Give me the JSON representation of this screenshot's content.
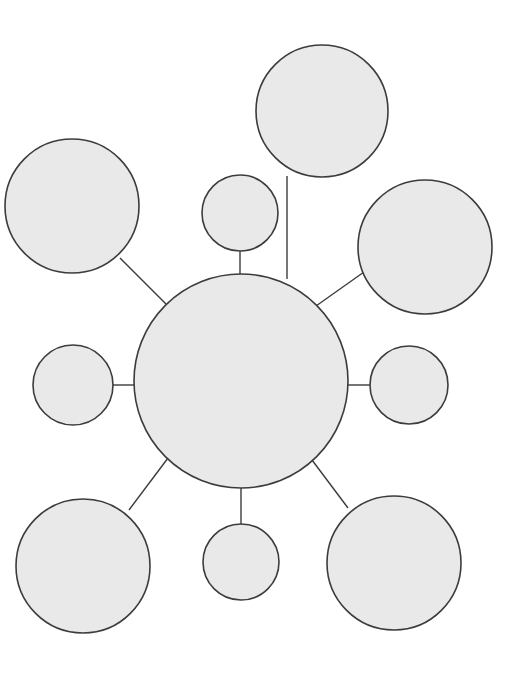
{
  "page": {
    "width": 523,
    "height": 687,
    "background_color": "#ffffff"
  },
  "style": {
    "node_fill": "#e9e9e9",
    "node_stroke": "#3c3c3c",
    "node_stroke_width": 1.6,
    "connector_stroke": "#3c3c3c",
    "connector_stroke_width": 1.4
  },
  "chart_data": {
    "type": "diagram",
    "subtype": "hub-and-spoke concept map",
    "title": "",
    "note": "Blank graphic organizer: one central hub circle linked by straight-line spokes to nine empty satellite circles. All circles are unlabeled.",
    "hub": {
      "id": "hub",
      "label": "",
      "cx": 241,
      "cy": 381,
      "r": 107,
      "size": "large"
    },
    "nodes": [
      {
        "id": "node-top-center-small",
        "label": "",
        "cx": 240,
        "cy": 213,
        "r": 38,
        "size": "small",
        "position": "top-center"
      },
      {
        "id": "node-top-right-large",
        "label": "",
        "cx": 322,
        "cy": 111,
        "r": 66,
        "size": "large",
        "position": "top-right"
      },
      {
        "id": "node-upper-left-large",
        "label": "",
        "cx": 72,
        "cy": 206,
        "r": 67,
        "size": "large",
        "position": "upper-left"
      },
      {
        "id": "node-right-upper-large",
        "label": "",
        "cx": 425,
        "cy": 247,
        "r": 67,
        "size": "large",
        "position": "right-upper"
      },
      {
        "id": "node-left-small",
        "label": "",
        "cx": 73,
        "cy": 385,
        "r": 40,
        "size": "small",
        "position": "left"
      },
      {
        "id": "node-right-small",
        "label": "",
        "cx": 409,
        "cy": 385,
        "r": 39,
        "size": "small",
        "position": "right"
      },
      {
        "id": "node-bottom-left-large",
        "label": "",
        "cx": 83,
        "cy": 566,
        "r": 67,
        "size": "large",
        "position": "bottom-left"
      },
      {
        "id": "node-bottom-center-small",
        "label": "",
        "cx": 241,
        "cy": 562,
        "r": 38,
        "size": "small",
        "position": "bottom-center"
      },
      {
        "id": "node-bottom-right-large",
        "label": "",
        "cx": 394,
        "cy": 563,
        "r": 67,
        "size": "large",
        "position": "bottom-right"
      }
    ],
    "edges": [
      {
        "id": "edge-hub-top-center-small",
        "from": "hub",
        "to": "node-top-center-small",
        "x1": 240,
        "y1": 275,
        "x2": 240,
        "y2": 251
      },
      {
        "id": "edge-hub-top-right-large",
        "from": "hub",
        "to": "node-top-right-large",
        "x1": 287,
        "y1": 279,
        "x2": 287,
        "y2": 176
      },
      {
        "id": "edge-hub-upper-left-large",
        "from": "hub",
        "to": "node-upper-left-large",
        "x1": 167,
        "y1": 305,
        "x2": 120,
        "y2": 258
      },
      {
        "id": "edge-hub-right-upper-large",
        "from": "hub",
        "to": "node-right-upper-large",
        "x1": 316,
        "y1": 306,
        "x2": 364,
        "y2": 272
      },
      {
        "id": "edge-hub-left-small",
        "from": "hub",
        "to": "node-left-small",
        "x1": 134,
        "y1": 385,
        "x2": 113,
        "y2": 385
      },
      {
        "id": "edge-hub-right-small",
        "from": "hub",
        "to": "node-right-small",
        "x1": 348,
        "y1": 385,
        "x2": 370,
        "y2": 385
      },
      {
        "id": "edge-hub-bottom-left-large",
        "from": "hub",
        "to": "node-bottom-left-large",
        "x1": 168,
        "y1": 458,
        "x2": 129,
        "y2": 510
      },
      {
        "id": "edge-hub-bottom-center-small",
        "from": "hub",
        "to": "node-bottom-center-small",
        "x1": 241,
        "y1": 488,
        "x2": 241,
        "y2": 524
      },
      {
        "id": "edge-hub-bottom-right-large",
        "from": "hub",
        "to": "node-bottom-right-large",
        "x1": 312,
        "y1": 460,
        "x2": 348,
        "y2": 508
      }
    ]
  }
}
